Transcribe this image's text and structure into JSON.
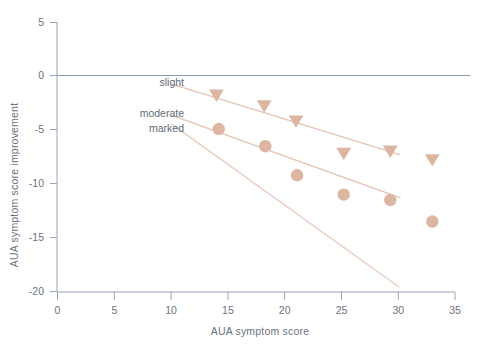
{
  "chart_data": {
    "type": "scatter",
    "title": "",
    "xlabel": "AUA symptom score",
    "ylabel": "AUA symptom score improvement",
    "xlim": [
      0,
      35
    ],
    "ylim": [
      -20,
      5
    ],
    "xticks": [
      0,
      5,
      10,
      15,
      20,
      25,
      30,
      35
    ],
    "yticks": [
      5,
      0,
      -5,
      -10,
      -15,
      -20
    ],
    "xtick_labels": [
      "0",
      "5",
      "10",
      "15",
      "20",
      "25",
      "30",
      "35"
    ],
    "ytick_labels": [
      "5",
      "0",
      "-5",
      "-10",
      "-15",
      "-20"
    ],
    "grid": false,
    "legend_position": "inline-left",
    "zero_line": {
      "y": 0,
      "color": "#8b9bbf"
    },
    "marker_color": "#ddb6a3",
    "line_color": "#e3c4b3",
    "series": [
      {
        "name": "slight",
        "label": "slight",
        "marker": "triangle-down",
        "points": [
          {
            "x": 14.0,
            "y": -1.8
          },
          {
            "x": 18.2,
            "y": -2.8
          },
          {
            "x": 21.0,
            "y": -4.2
          },
          {
            "x": 25.2,
            "y": -7.2
          },
          {
            "x": 29.3,
            "y": -7.0
          },
          {
            "x": 33.0,
            "y": -7.8
          }
        ],
        "trend_line": {
          "x0": 10.0,
          "y0": -0.7,
          "x1": 30.2,
          "y1": -7.3
        }
      },
      {
        "name": "moderate",
        "label": "moderate",
        "marker": "circle",
        "points": [
          {
            "x": 14.2,
            "y": -4.9
          },
          {
            "x": 18.3,
            "y": -6.5
          },
          {
            "x": 21.1,
            "y": -9.2
          },
          {
            "x": 25.2,
            "y": -11.0
          },
          {
            "x": 29.3,
            "y": -11.5
          },
          {
            "x": 33.0,
            "y": -13.5
          }
        ],
        "trend_line": {
          "x0": 10.0,
          "y0": -3.6,
          "x1": 30.2,
          "y1": -11.3
        }
      },
      {
        "name": "marked",
        "label": "marked",
        "marker": "none",
        "points": [],
        "trend_line": {
          "x0": 10.0,
          "y0": -4.4,
          "x1": 30.1,
          "y1": -19.6
        }
      }
    ]
  },
  "labels": {
    "slight": "slight",
    "moderate": "moderate",
    "marked": "marked"
  },
  "axis": {
    "x_title": "AUA symptom score",
    "y_title": "AUA symptom score improvement"
  }
}
